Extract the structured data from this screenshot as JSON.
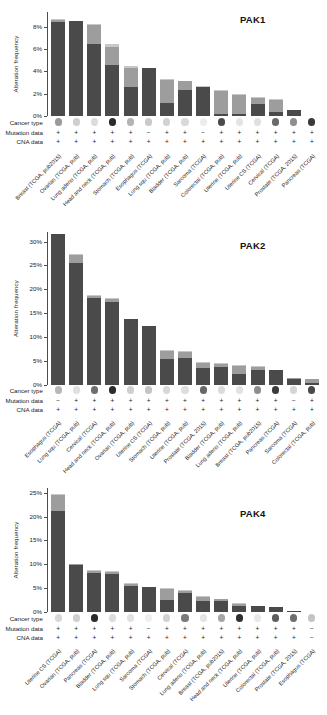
{
  "figure": {
    "axis_label": "Alteration frequency",
    "row_labels": {
      "cancer_type": "Cancer type",
      "mutation_data": "Mutation data",
      "cna_data": "CNA data"
    },
    "colors": {
      "amplification": "#d9534f",
      "deep_deletion": "#3a6fb0",
      "mutation": "#2f8f3e",
      "multiple": "#5a5a5a",
      "bar_dark": "#4a4a4a",
      "bar_mid": "#8c8c8c",
      "bar_light": "#c4c4c4",
      "axis": "#4d4d4d",
      "text": "#1a1a1a"
    }
  },
  "chart_data": [
    {
      "type": "bar",
      "title": "PAK1",
      "ylabel": "Alteration frequency",
      "xlabel": "",
      "ylim": [
        0,
        9.3
      ],
      "yticks": [
        0,
        2,
        4,
        6,
        8
      ],
      "ytick_labels": [
        "0%",
        "2%",
        "4%",
        "6%",
        "8%"
      ],
      "grid": false,
      "legend": "none",
      "categories": [
        "Breast (TCGA, pub2015)",
        "Ovarian (TCGA, pub)",
        "Lung adeno (TCGA, pub)",
        "Head and neck (TCGA, pub)",
        "Stomach (TCGA, pub)",
        "Esophagus (TCGA)",
        "Lung squ (TCGA, pub)",
        "Bladder (TCGA, pub)",
        "Sarcoma (TCGA)",
        "Colorectal (TCGA, pub)",
        "Uterine (TCGA, pub)",
        "Uterine CS (TCGA)",
        "Cervical (TCGA)",
        "Prostate (TCGA, 2015)",
        "Pancreas (TCGA)"
      ],
      "values": [
        8.7,
        8.5,
        8.2,
        6.4,
        4.5,
        4.3,
        3.3,
        3.1,
        2.7,
        2.3,
        2.0,
        1.7,
        1.5,
        0.5,
        0.0
      ],
      "series": [
        {
          "name": "Amplification",
          "values": [
            8.4,
            8.5,
            6.4,
            4.6,
            2.6,
            4.3,
            1.2,
            2.3,
            2.6,
            0.2,
            0.2,
            1.1,
            0.4,
            0.5,
            0.0
          ]
        },
        {
          "name": "Deep Deletion",
          "values": [
            0.0,
            0.0,
            0.0,
            0.0,
            0.0,
            0.0,
            0.0,
            0.0,
            0.0,
            0.0,
            0.0,
            0.0,
            0.0,
            0.0,
            0.0
          ]
        },
        {
          "name": "Mutation",
          "values": [
            0.2,
            0.0,
            1.7,
            1.6,
            1.7,
            0.0,
            2.0,
            0.8,
            0.0,
            2.0,
            1.7,
            0.5,
            1.0,
            0.0,
            0.0
          ]
        },
        {
          "name": "Multiple alterations",
          "values": [
            0.1,
            0.0,
            0.1,
            0.2,
            0.2,
            0.0,
            0.1,
            0.0,
            0.1,
            0.1,
            0.1,
            0.1,
            0.1,
            0.0,
            0.0
          ]
        }
      ],
      "cancer_type_dots": [
        "#9a9a9a",
        "#cfcfcf",
        "#dcdcdc",
        "#2b2b2b",
        "#b4b4b4",
        "#c9c9c9",
        "#d2d2d2",
        "#dadada",
        "#ededed",
        "#4a4a4a",
        "#e4e4e4",
        "#e0e0e0",
        "#6a6a6a",
        "#8f8f8f",
        "#3a3a3a"
      ],
      "mutation_data": [
        "+",
        "+",
        "+",
        "+",
        "+",
        "−",
        "+",
        "+",
        "−",
        "+",
        "+",
        "+",
        "+",
        "+",
        "+"
      ],
      "cna_data": [
        "+",
        "+",
        "+",
        "+",
        "+",
        "+",
        "+",
        "+",
        "+",
        "+",
        "+",
        "+",
        "+",
        "+",
        "+"
      ]
    },
    {
      "type": "bar",
      "title": "PAK2",
      "ylabel": "Alteration frequency",
      "xlabel": "",
      "ylim": [
        0,
        32
      ],
      "yticks": [
        0,
        5,
        10,
        15,
        20,
        25,
        30
      ],
      "ytick_labels": [
        "0%",
        "5%",
        "10%",
        "15%",
        "20%",
        "25%",
        "30%"
      ],
      "grid": false,
      "legend": "none",
      "categories": [
        "Esophagus (TCGA)",
        "Lung squ (TCGA, pub)",
        "Cervical (TCGA)",
        "Head and neck (TCGA, pub)",
        "Ovarian (TCGA, pub)",
        "Uterine CS (TCGA)",
        "Stomach (TCGA, pub)",
        "Uterine (TCGA, pub)",
        "Prostate (TCGA, 2015)",
        "Bladder (TCGA, pub)",
        "Lung adeno (TCGA, pub)",
        "Breast (TCGA, pub2015)",
        "Pancreas (TCGA)",
        "Sarcoma (TCGA)",
        "Colorectal (TCGA, pub)"
      ],
      "values": [
        31.5,
        27.4,
        18.7,
        18.1,
        13.9,
        12.3,
        7.4,
        7.2,
        4.9,
        4.5,
        4.1,
        3.9,
        3.2,
        1.5,
        1.2
      ],
      "series": [
        {
          "name": "Amplification",
          "values": [
            31.5,
            25.6,
            18.2,
            17.4,
            13.9,
            12.3,
            5.5,
            5.6,
            3.5,
            3.7,
            2.4,
            3.2,
            3.2,
            1.2,
            0.4
          ]
        },
        {
          "name": "Deep Deletion",
          "values": [
            0.0,
            0.0,
            0.0,
            0.0,
            0.0,
            0.0,
            0.0,
            0.0,
            0.0,
            0.0,
            0.0,
            0.0,
            0.0,
            0.0,
            0.0
          ]
        },
        {
          "name": "Mutation",
          "values": [
            0.0,
            1.5,
            0.4,
            0.6,
            0.0,
            0.0,
            1.6,
            1.4,
            1.2,
            0.7,
            1.6,
            0.6,
            0.0,
            0.3,
            0.8
          ]
        },
        {
          "name": "Multiple alterations",
          "values": [
            0.0,
            0.3,
            0.1,
            0.1,
            0.0,
            0.0,
            0.3,
            0.2,
            0.2,
            0.1,
            0.1,
            0.1,
            0.0,
            0.0,
            0.0
          ]
        }
      ],
      "cancer_type_dots": [
        "#b7b7b7",
        "#e0e0e0",
        "#6e6e6e",
        "#2b2b2b",
        "#cfcfcf",
        "#c4c4c4",
        "#d8d8d8",
        "#dedede",
        "#676767",
        "#dcdcdc",
        "#e2e2e2",
        "#8e8e8e",
        "#3a3a3a",
        "#d6d6d6",
        "#4a4a4a"
      ],
      "mutation_data": [
        "−",
        "+",
        "+",
        "+",
        "+",
        "+",
        "+",
        "+",
        "+",
        "+",
        "+",
        "+",
        "+",
        "−",
        "+"
      ],
      "cna_data": [
        "+",
        "+",
        "+",
        "+",
        "+",
        "+",
        "+",
        "+",
        "+",
        "+",
        "+",
        "+",
        "+",
        "+",
        "+"
      ]
    },
    {
      "type": "bar",
      "title": "PAK4",
      "ylabel": "Alteration frequency",
      "xlabel": "",
      "ylim": [
        0,
        26
      ],
      "yticks": [
        0,
        5,
        10,
        15,
        20,
        25
      ],
      "ytick_labels": [
        "0%",
        "5%",
        "10%",
        "15%",
        "20%",
        "25%"
      ],
      "grid": false,
      "legend": "none",
      "categories": [
        "Uterine CS (TCGA)",
        "Ovarian (TCGA, pub)",
        "Pancreas (TCGA)",
        "Bladder (TCGA, pub)",
        "Lung squ (TCGA, pub)",
        "Sarcoma (TCGA)",
        "Stomach (TCGA, pub)",
        "Cervical (TCGA)",
        "Lung adeno (TCGA, pub)",
        "Breast (TCGA, pub2015)",
        "Head and neck (TCGA, pub)",
        "Uterine (TCGA, pub)",
        "Colorectal (TCGA, pub)",
        "Prostate (TCGA, 2015)",
        "Esophagus (TCGA)"
      ],
      "values": [
        24.8,
        10.1,
        8.8,
        8.5,
        6.0,
        5.3,
        5.0,
        4.5,
        3.3,
        2.7,
        1.8,
        1.3,
        1.1,
        0.2,
        0.0
      ],
      "series": [
        {
          "name": "Amplification",
          "values": [
            21.2,
            9.9,
            8.2,
            8.0,
            5.5,
            5.3,
            2.5,
            3.9,
            2.3,
            2.3,
            1.2,
            1.2,
            1.0,
            0.2,
            0.0
          ]
        },
        {
          "name": "Deep Deletion",
          "values": [
            0.0,
            0.0,
            0.0,
            0.0,
            0.0,
            0.0,
            0.0,
            0.0,
            0.0,
            0.0,
            0.0,
            0.0,
            0.0,
            0.0,
            0.0
          ]
        },
        {
          "name": "Mutation",
          "values": [
            3.4,
            0.2,
            0.5,
            0.4,
            0.4,
            0.0,
            2.3,
            0.5,
            0.9,
            0.4,
            0.5,
            0.1,
            0.1,
            0.0,
            0.0
          ]
        },
        {
          "name": "Multiple alterations",
          "values": [
            0.2,
            0.0,
            0.1,
            0.1,
            0.1,
            0.0,
            0.2,
            0.1,
            0.1,
            0.0,
            0.1,
            0.0,
            0.0,
            0.0,
            0.0
          ]
        }
      ],
      "cancer_type_dots": [
        "#d8d8d8",
        "#cfcfcf",
        "#2b2b2b",
        "#dcdcdc",
        "#e2e2e2",
        "#efefef",
        "#d2d2d2",
        "#7a7a7a",
        "#e4e4e4",
        "#a6a6a6",
        "#2f2f2f",
        "#e8e8e8",
        "#5e5e5e",
        "#6e6e6e",
        "#c4c4c4"
      ],
      "mutation_data": [
        "+",
        "+",
        "+",
        "+",
        "+",
        "−",
        "+",
        "+",
        "+",
        "+",
        "+",
        "+",
        "+",
        "+",
        "−"
      ],
      "cna_data": [
        "+",
        "+",
        "+",
        "+",
        "+",
        "+",
        "+",
        "+",
        "+",
        "+",
        "+",
        "+",
        "+",
        "+",
        "−"
      ]
    }
  ]
}
